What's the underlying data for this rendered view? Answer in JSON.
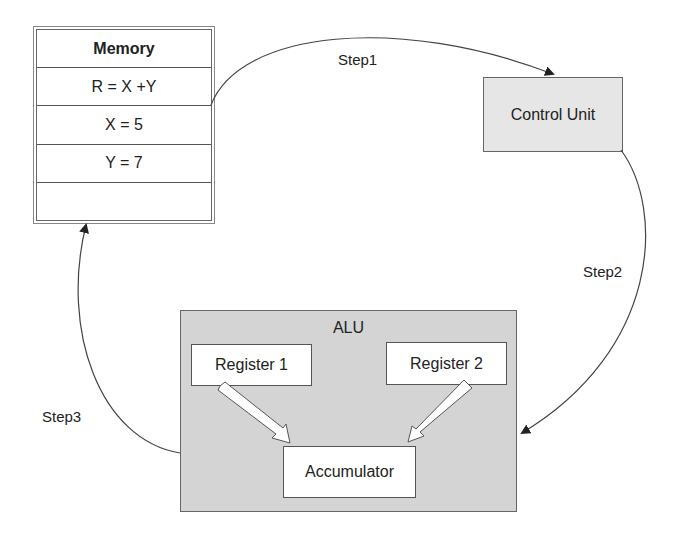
{
  "memory": {
    "title": "Memory",
    "rows": [
      "R = X +Y",
      "X = 5",
      "Y = 7",
      ""
    ]
  },
  "control_unit": {
    "label": "Control Unit"
  },
  "alu": {
    "title": "ALU",
    "register1": "Register 1",
    "register2": "Register 2",
    "accumulator": "Accumulator"
  },
  "steps": {
    "step1": "Step1",
    "step2": "Step2",
    "step3": "Step3"
  },
  "colors": {
    "control_unit_fill": "#e6e6e6",
    "alu_fill": "#d4d4d4",
    "box_fill": "#ffffff",
    "line": "#444444"
  }
}
